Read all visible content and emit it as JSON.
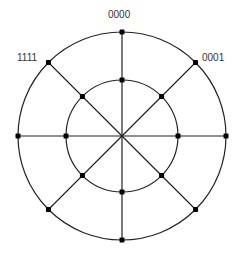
{
  "diagram": {
    "type": "two-ring radial network",
    "center": [
      122,
      136
    ],
    "outer_radius": 104,
    "inner_radius": 56,
    "spokes": 8,
    "stroke_color": "#222222",
    "node_color": "#000000",
    "labels": [
      {
        "text": "0000",
        "position": "top",
        "x": 108,
        "y": 10
      },
      {
        "text": "0001",
        "position": "upper-right",
        "x": 202,
        "y": 53
      },
      {
        "text": "1111",
        "position": "upper-left",
        "x": 17,
        "y": 53
      }
    ]
  }
}
